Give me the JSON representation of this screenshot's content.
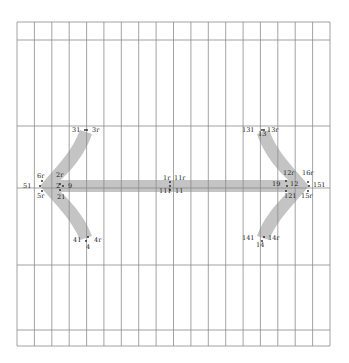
{
  "colors": {
    "grid": "#8c8c8c",
    "arrow": "#c4c4c4",
    "text": "#222222",
    "point": "#222222"
  },
  "grid": {
    "x0": 17,
    "x1": 330,
    "columns": 18,
    "top": 22,
    "bottom": 346,
    "horizontals": [
      22,
      40,
      126,
      188,
      265,
      330,
      346
    ]
  },
  "labels": [
    {
      "id": "31",
      "text": "31",
      "x": 72,
      "y": 132
    },
    {
      "id": "3r",
      "text": "3r",
      "x": 92,
      "y": 132
    },
    {
      "id": "6r",
      "text": "6r",
      "x": 37,
      "y": 178
    },
    {
      "id": "2r",
      "text": "2r",
      "x": 56,
      "y": 177
    },
    {
      "id": "51",
      "text": "51",
      "x": 23,
      "y": 188
    },
    {
      "id": "2",
      "text": "2",
      "x": 56,
      "y": 188
    },
    {
      "id": "9",
      "text": "9",
      "x": 68,
      "y": 188
    },
    {
      "id": "5r",
      "text": "5r",
      "x": 37,
      "y": 198
    },
    {
      "id": "21",
      "text": "21",
      "x": 57,
      "y": 199
    },
    {
      "id": "41",
      "text": "41",
      "x": 73,
      "y": 242
    },
    {
      "id": "4r",
      "text": "4r",
      "x": 94,
      "y": 242
    },
    {
      "id": "4",
      "text": "4",
      "x": 86,
      "y": 249
    },
    {
      "id": "1r",
      "text": "1r",
      "x": 163,
      "y": 180
    },
    {
      "id": "11r",
      "text": "11r",
      "x": 174,
      "y": 180
    },
    {
      "id": "111",
      "text": "111",
      "x": 159,
      "y": 193
    },
    {
      "id": "11",
      "text": "11",
      "x": 175,
      "y": 193
    },
    {
      "id": "131",
      "text": "131",
      "x": 242,
      "y": 132
    },
    {
      "id": "13r",
      "text": "13r",
      "x": 267,
      "y": 132
    },
    {
      "id": "13",
      "text": "13",
      "x": 258,
      "y": 136
    },
    {
      "id": "12r",
      "text": "12r",
      "x": 283,
      "y": 175
    },
    {
      "id": "16r",
      "text": "16r",
      "x": 302,
      "y": 175
    },
    {
      "id": "19",
      "text": "19",
      "x": 272,
      "y": 186
    },
    {
      "id": "12",
      "text": "12",
      "x": 290,
      "y": 186
    },
    {
      "id": "151",
      "text": "151",
      "x": 313,
      "y": 187
    },
    {
      "id": "121",
      "text": "121",
      "x": 284,
      "y": 198
    },
    {
      "id": "15r",
      "text": "15r",
      "x": 301,
      "y": 198
    },
    {
      "id": "141",
      "text": "141",
      "x": 242,
      "y": 240
    },
    {
      "id": "14r",
      "text": "14r",
      "x": 268,
      "y": 240
    },
    {
      "id": "14",
      "text": "14",
      "x": 256,
      "y": 247
    }
  ],
  "points": [
    [
      85,
      130
    ],
    [
      87,
      130
    ],
    [
      40,
      186
    ],
    [
      42,
      181
    ],
    [
      42,
      191
    ],
    [
      60,
      184
    ],
    [
      63,
      186
    ],
    [
      60,
      190
    ],
    [
      88,
      237
    ],
    [
      86,
      241
    ],
    [
      170,
      182
    ],
    [
      170,
      186
    ],
    [
      170,
      190
    ],
    [
      262,
      130
    ],
    [
      264,
      130
    ],
    [
      286,
      181
    ],
    [
      287,
      186
    ],
    [
      286,
      191
    ],
    [
      308,
      182
    ],
    [
      309,
      186
    ],
    [
      308,
      191
    ],
    [
      264,
      237
    ],
    [
      262,
      241
    ]
  ]
}
